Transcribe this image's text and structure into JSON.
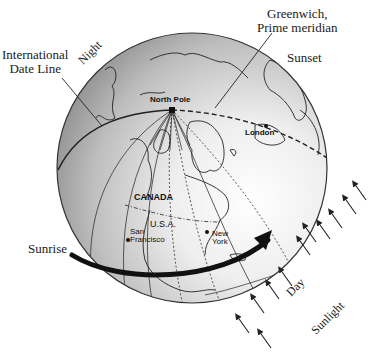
{
  "labels": {
    "international_date_line": [
      "International",
      "Date Line"
    ],
    "night": "Night",
    "greenwich": [
      "Greenwich,",
      "Prime meridian"
    ],
    "sunset": "Sunset",
    "north_pole": "North Pole",
    "london": "London",
    "canada": "CANADA",
    "usa": "U.S.A.",
    "san_francisco": [
      "San",
      "Francisco"
    ],
    "new_york": [
      "New",
      "York"
    ],
    "sunrise": "Sunrise",
    "day": "Day",
    "sunlight": "Sunlight"
  },
  "colors": {
    "ink": "#1a1a1a",
    "globe_dark": "#8a8a8a",
    "globe_light": "#f4f4f4",
    "background": "#ffffff"
  },
  "globe": {
    "cx": 192,
    "cy": 168,
    "r": 135
  },
  "sunlight_arrows": 9
}
